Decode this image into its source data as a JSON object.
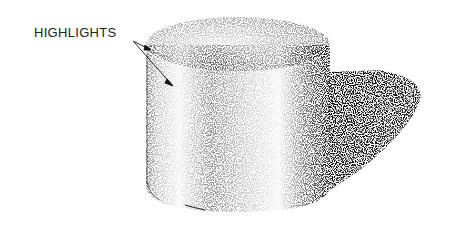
{
  "figure": {
    "label": "HIGHLIGHTS",
    "arrow_count": 2,
    "colors": {
      "ink": "#111111",
      "background": "#ffffff"
    }
  }
}
